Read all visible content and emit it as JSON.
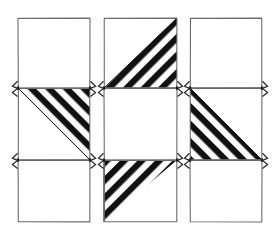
{
  "figure": {
    "kind": "technical-line-drawing",
    "background_color": "#ffffff",
    "outline_color": "#6b6b6b",
    "hatch_color": "#111111",
    "hatch_gap_color": "#ffffff",
    "stroke_width": 1.1,
    "hatch_band_width": 6.2,
    "hatch_period": 12.4,
    "columns": [
      {
        "id": "column-1",
        "label": "1",
        "x": 18,
        "width": 72,
        "panels": [
          {
            "id": "c1-panel-top",
            "label": "1-top",
            "y": 18,
            "height": 70,
            "fill": "blank",
            "hatch_region": "none",
            "hatch_direction": "none"
          },
          {
            "id": "c1-panel-middle",
            "label": "1-middle",
            "y": 88,
            "height": 72,
            "fill": "hatched",
            "hatch_region": "upper-right-triangle",
            "hatch_direction": "descending"
          },
          {
            "id": "c1-panel-bottom",
            "label": "1-bottom",
            "y": 160,
            "height": 62,
            "fill": "blank",
            "hatch_region": "none",
            "hatch_direction": "none"
          }
        ]
      },
      {
        "id": "column-2",
        "label": "2",
        "x": 104,
        "width": 73,
        "panels": [
          {
            "id": "c2-panel-top",
            "label": "2-top",
            "y": 18,
            "height": 70,
            "fill": "hatched",
            "hatch_region": "lower-right-triangle",
            "hatch_direction": "ascending"
          },
          {
            "id": "c2-panel-middle",
            "label": "2-middle",
            "y": 88,
            "height": 72,
            "fill": "blank",
            "hatch_region": "none",
            "hatch_direction": "none"
          },
          {
            "id": "c2-panel-bottom",
            "label": "2-bottom",
            "y": 160,
            "height": 62,
            "fill": "hatched",
            "hatch_region": "upper-left-triangle",
            "hatch_direction": "ascending"
          }
        ]
      },
      {
        "id": "column-3",
        "label": "3",
        "x": 190,
        "width": 72,
        "panels": [
          {
            "id": "c3-panel-top",
            "label": "3-top",
            "y": 18,
            "height": 70,
            "fill": "blank",
            "hatch_region": "none",
            "hatch_direction": "none"
          },
          {
            "id": "c3-panel-middle",
            "label": "3-middle",
            "y": 88,
            "height": 72,
            "fill": "hatched",
            "hatch_region": "lower-left-triangle",
            "hatch_direction": "descending"
          },
          {
            "id": "c3-panel-bottom",
            "label": "3-bottom",
            "y": 160,
            "height": 62,
            "fill": "blank",
            "hatch_region": "none",
            "hatch_direction": "none"
          }
        ]
      }
    ],
    "joints": {
      "description": "Small dark clamp/bracket fittings at left and right edges where two stacked panels meet.",
      "color": "#222222",
      "rows_y": [
        88,
        160
      ],
      "size": 9
    }
  }
}
